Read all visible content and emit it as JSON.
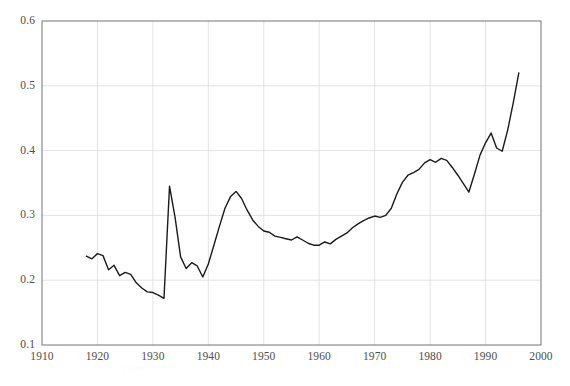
{
  "chart_data": {
    "type": "line",
    "title": "",
    "subtitle": "",
    "xlabel": "",
    "ylabel": "",
    "xlim": [
      1910,
      2000
    ],
    "ylim": [
      0.1,
      0.6
    ],
    "xticks": [
      "1910",
      "1920",
      "1930",
      "1940",
      "1950",
      "1960",
      "1970",
      "1980",
      "1990",
      "2000"
    ],
    "yticks": [
      "0.1",
      "0.2",
      "0.3",
      "0.4",
      "0.5",
      "0.6"
    ],
    "xtick_values": [
      1910,
      1920,
      1930,
      1940,
      1950,
      1960,
      1970,
      1980,
      1990,
      2000
    ],
    "ytick_values": [
      0.1,
      0.2,
      0.3,
      0.4,
      0.5,
      0.6
    ],
    "grid": true,
    "grid_color": "#dcdcdc",
    "legend": null,
    "legend_position": "none",
    "line_color": "#1a1a1a",
    "line_width": 1.4,
    "axis_color": "#808080",
    "background": "#ffffff",
    "annotations": [],
    "series": [
      {
        "name": "series-1",
        "x": [
          1918,
          1919,
          1920,
          1921,
          1922,
          1923,
          1924,
          1925,
          1926,
          1927,
          1928,
          1929,
          1930,
          1931,
          1932,
          1933,
          1934,
          1935,
          1936,
          1937,
          1938,
          1939,
          1940,
          1941,
          1942,
          1943,
          1944,
          1945,
          1946,
          1947,
          1948,
          1949,
          1950,
          1951,
          1952,
          1953,
          1954,
          1955,
          1956,
          1957,
          1958,
          1959,
          1960,
          1961,
          1962,
          1963,
          1964,
          1965,
          1966,
          1967,
          1968,
          1969,
          1970,
          1971,
          1972,
          1973,
          1974,
          1975,
          1976,
          1977,
          1978,
          1979,
          1980,
          1981,
          1982,
          1983,
          1984,
          1985,
          1986,
          1987,
          1988,
          1989,
          1990,
          1991,
          1992,
          1993,
          1994,
          1995,
          1996
        ],
        "y": [
          0.237,
          0.233,
          0.241,
          0.238,
          0.216,
          0.223,
          0.207,
          0.212,
          0.209,
          0.196,
          0.188,
          0.182,
          0.181,
          0.177,
          0.172,
          0.345,
          0.297,
          0.236,
          0.218,
          0.227,
          0.222,
          0.205,
          0.225,
          0.254,
          0.283,
          0.311,
          0.329,
          0.337,
          0.326,
          0.308,
          0.293,
          0.283,
          0.276,
          0.274,
          0.268,
          0.266,
          0.264,
          0.262,
          0.267,
          0.262,
          0.257,
          0.254,
          0.254,
          0.259,
          0.256,
          0.263,
          0.268,
          0.273,
          0.281,
          0.287,
          0.292,
          0.296,
          0.299,
          0.297,
          0.3,
          0.311,
          0.333,
          0.351,
          0.362,
          0.366,
          0.371,
          0.381,
          0.386,
          0.382,
          0.388,
          0.385,
          0.374,
          0.362,
          0.349,
          0.336,
          0.364,
          0.393,
          0.412,
          0.427,
          0.404,
          0.399,
          0.432,
          0.474,
          0.52
        ]
      }
    ]
  },
  "axes": {
    "y_tick_labels": [
      "0.6",
      "0.5",
      "0.4",
      "0.3",
      "0.2",
      "0.1"
    ],
    "x_tick_labels": [
      "1910",
      "1920",
      "1930",
      "1940",
      "1950",
      "1960",
      "1970",
      "1980",
      "1990",
      "2000"
    ]
  },
  "ghost_caption": "Figure"
}
